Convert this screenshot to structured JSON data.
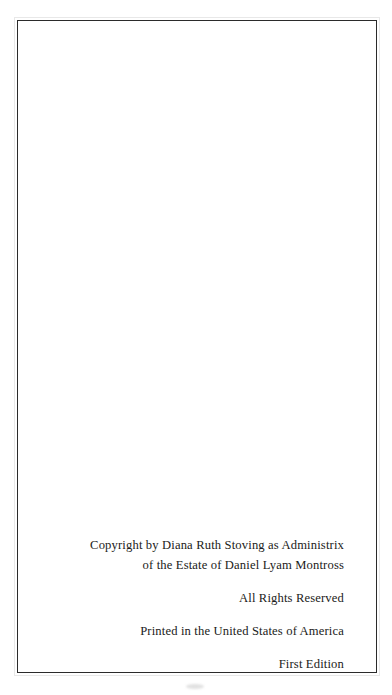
{
  "page": {
    "kind": "book-copyright-page",
    "background_color": "#ffffff",
    "border_color": "#2b2b2b",
    "text_color": "#1b1b20"
  },
  "colophon": {
    "copyright": {
      "line1": "Copyright by Diana Ruth Stoving as Administrix",
      "line2": "of the Estate of Daniel Lyam Montross"
    },
    "rights": {
      "line1": "All Rights Reserved"
    },
    "printing": {
      "line1": "Printed in the United States of America"
    },
    "edition": {
      "line1": "First Edition"
    }
  }
}
